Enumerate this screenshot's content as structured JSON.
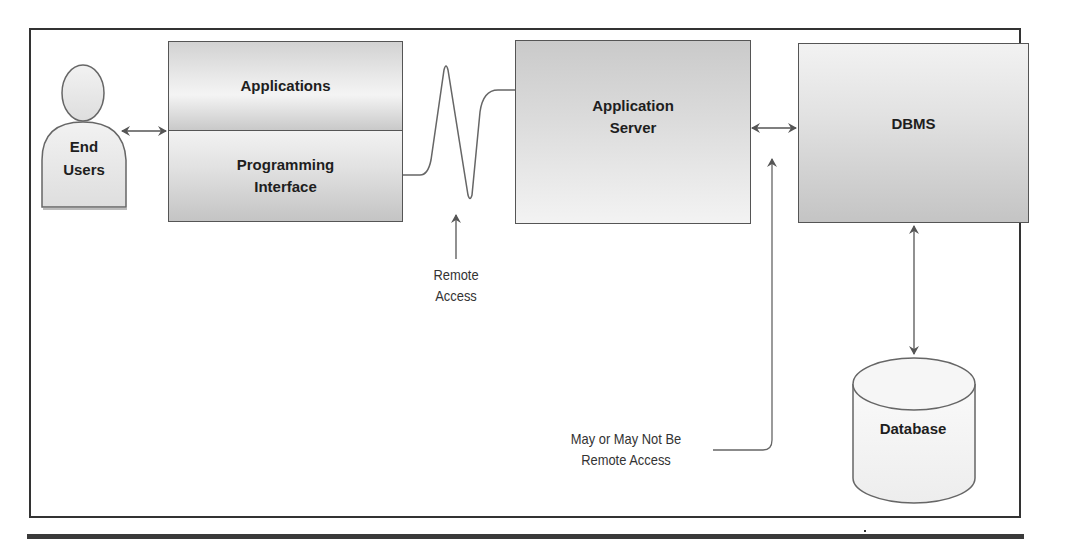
{
  "diagram": {
    "title": "",
    "nodes": {
      "end_users": {
        "line1": "End",
        "line2": "Users",
        "shape": "person"
      },
      "applications": {
        "label": "Applications"
      },
      "programming_interface": {
        "line1": "Programming",
        "line2": "Interface"
      },
      "application_server": {
        "line1": "Application",
        "line2": "Server"
      },
      "dbms": {
        "label": "DBMS"
      },
      "database": {
        "label": "Database",
        "shape": "cylinder"
      }
    },
    "annotations": {
      "remote_access": {
        "line1": "Remote",
        "line2": "Access"
      },
      "may_or_may_not": {
        "line1": "May or May Not Be",
        "line2": "Remote Access"
      }
    },
    "edges": [
      {
        "from": "end_users",
        "to": "applications_programming_interface",
        "type": "bidirectional-arrow"
      },
      {
        "from": "programming_interface",
        "to": "application_server",
        "type": "remote-wave"
      },
      {
        "from": "application_server",
        "to": "dbms",
        "type": "bidirectional-arrow"
      },
      {
        "from": "dbms",
        "to": "database",
        "type": "bidirectional-arrow"
      },
      {
        "from": "remote_access_label",
        "to": "remote-wave",
        "type": "pointer-arrow"
      },
      {
        "from": "may_or_may_not_label",
        "to": "server-dbms-link",
        "type": "pointer-arrow"
      }
    ],
    "colors": {
      "stroke": "#555555",
      "frame": "#333333",
      "box_fill_light": "#ececec",
      "box_fill_dark": "#c4c4c4",
      "text": "#1e1e1e"
    }
  }
}
